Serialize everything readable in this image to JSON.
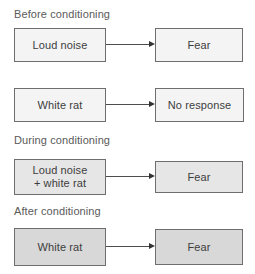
{
  "figure": {
    "kind": "flow-diagram",
    "topic": "Classical conditioning (Little Albert)",
    "colors": {
      "border": "#6e6e6e",
      "text": "#3d3d3d",
      "heading": "#5a5a5a",
      "arrow": "#333333",
      "fill_light": "#f4f4f4",
      "fill_medium": "#e6e6e6",
      "fill_gray": "#d8d8d8",
      "background": "#ffffff"
    }
  },
  "sections": [
    {
      "id": "before",
      "title": "Before conditioning",
      "rows": [
        {
          "id": "before-row-1",
          "stimulus": "Loud noise",
          "response": "Fear",
          "arrow": "arrow-right"
        },
        {
          "id": "before-row-2",
          "stimulus": "White rat",
          "response": "No response",
          "arrow": "arrow-right"
        }
      ]
    },
    {
      "id": "during",
      "title": "During conditioning",
      "rows": [
        {
          "id": "during-row-1",
          "stimulus": "Loud noise\n+ white rat",
          "response": "Fear",
          "arrow": "arrow-right"
        }
      ]
    },
    {
      "id": "after",
      "title": "After conditioning",
      "rows": [
        {
          "id": "after-row-1",
          "stimulus": "White rat",
          "response": "Fear",
          "arrow": "arrow-right"
        }
      ]
    }
  ]
}
